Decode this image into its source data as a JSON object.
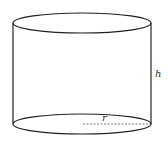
{
  "diagram": {
    "shape": "cylinder",
    "labels": {
      "height": "h",
      "radius": "r"
    },
    "colors": {
      "stroke": "#222222",
      "dash": "#555555",
      "background": "#ffffff"
    }
  }
}
